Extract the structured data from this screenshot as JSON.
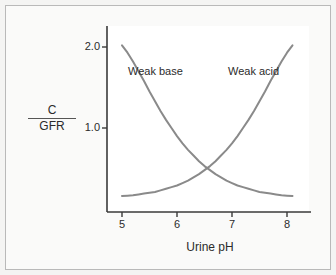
{
  "figure": {
    "background_color": "#fafaf9",
    "border_color": "#b9b9b9",
    "plot_background_color": "#ffffff",
    "axis_color": "#3a3a3a",
    "curve_color": "#8a8a8a",
    "text_color": "#2b2b2b"
  },
  "axes": {
    "y_title_numerator": "C",
    "y_title_denominator": "GFR",
    "x_title": "Urine pH",
    "y_ticks": [
      "1.0",
      "2.0"
    ],
    "x_ticks": [
      "5",
      "6",
      "7",
      "8"
    ]
  },
  "labels": {
    "weak_base": "Weak base",
    "weak_acid": "Weak acid"
  },
  "chart_data": {
    "type": "line",
    "title": "",
    "xlabel": "Urine pH",
    "ylabel": "C/GFR",
    "xlim": [
      4.85,
      8.15
    ],
    "ylim": [
      0.0,
      2.25
    ],
    "grid": false,
    "legend": "inline-annotations",
    "x_tick_values": [
      5,
      6,
      7,
      8
    ],
    "y_tick_values": [
      1.0,
      2.0
    ],
    "annotations": [
      {
        "text": "Weak base",
        "x": 5.35,
        "y": 1.72
      },
      {
        "text": "Weak acid",
        "x": 7.2,
        "y": 1.72
      }
    ],
    "crossing_point": {
      "x": 6.55,
      "y": 0.43
    },
    "series": [
      {
        "name": "Weak base",
        "color": "#8a8a8a",
        "x": [
          5.0,
          5.1,
          5.2,
          5.3,
          5.4,
          5.5,
          5.6,
          5.7,
          5.8,
          5.9,
          6.0,
          6.1,
          6.2,
          6.3,
          6.4,
          6.5,
          6.6,
          6.7,
          6.8,
          6.9,
          7.0,
          7.1,
          7.2,
          7.3,
          7.4,
          7.5,
          7.6,
          7.7,
          7.8,
          7.9,
          8.0,
          8.1
        ],
        "values": [
          2.02,
          1.93,
          1.82,
          1.7,
          1.58,
          1.45,
          1.33,
          1.21,
          1.1,
          1.0,
          0.9,
          0.81,
          0.73,
          0.66,
          0.59,
          0.53,
          0.48,
          0.43,
          0.39,
          0.35,
          0.32,
          0.29,
          0.27,
          0.25,
          0.23,
          0.21,
          0.2,
          0.19,
          0.18,
          0.17,
          0.165,
          0.16
        ]
      },
      {
        "name": "Weak acid",
        "color": "#8a8a8a",
        "x": [
          5.0,
          5.1,
          5.2,
          5.3,
          5.4,
          5.5,
          5.6,
          5.7,
          5.8,
          5.9,
          6.0,
          6.1,
          6.2,
          6.3,
          6.4,
          6.5,
          6.6,
          6.7,
          6.8,
          6.9,
          7.0,
          7.1,
          7.2,
          7.3,
          7.4,
          7.5,
          7.6,
          7.7,
          7.8,
          7.9,
          8.0,
          8.1
        ],
        "values": [
          0.16,
          0.165,
          0.17,
          0.18,
          0.19,
          0.2,
          0.21,
          0.23,
          0.25,
          0.27,
          0.29,
          0.32,
          0.35,
          0.39,
          0.43,
          0.48,
          0.53,
          0.59,
          0.66,
          0.73,
          0.81,
          0.9,
          1.0,
          1.1,
          1.21,
          1.33,
          1.45,
          1.58,
          1.7,
          1.82,
          1.93,
          2.02
        ]
      }
    ]
  }
}
